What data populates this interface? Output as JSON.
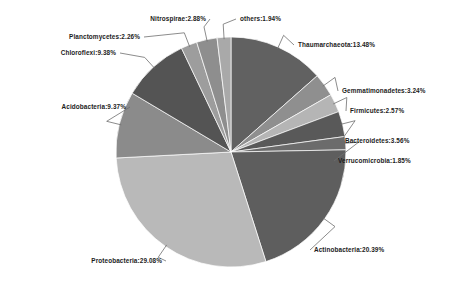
{
  "chart_data": {
    "type": "pie",
    "title": "",
    "subtitle": "",
    "xlabel": "",
    "ylabel": "",
    "legend_position": "none",
    "grid": false,
    "units": "percent",
    "label_format": "name:value%",
    "start_angle_deg": 0,
    "direction": "clockwise",
    "categories": [
      "Thaumarchaeota",
      "Gemmatimonadetes",
      "Firmicutes",
      "Bacteroidetes",
      "Verrucomicrobia",
      "Actinobacteria",
      "Proteobacteria",
      "Acidobacteria",
      "Chloroflexi",
      "Planctomycetes",
      "Nitrospirae",
      "others"
    ],
    "values": [
      13.48,
      3.24,
      2.57,
      3.56,
      1.85,
      20.39,
      29.08,
      9.37,
      9.38,
      2.26,
      2.88,
      1.94
    ],
    "colors": [
      "#616161",
      "#8f8f8f",
      "#b5b5b5",
      "#595959",
      "#6b6b6b",
      "#5e5e5e",
      "#b9b9b9",
      "#8b8b8b",
      "#545454",
      "#9d9d9d",
      "#8e8e8e",
      "#a9a9a9"
    ],
    "slices": [
      {
        "label": "Thaumarchaeota:13.48%",
        "name": "Thaumarchaeota",
        "value": 13.48,
        "color": "#616161"
      },
      {
        "label": "Gemmatimonadetes:3.24%",
        "name": "Gemmatimonadetes",
        "value": 3.24,
        "color": "#8f8f8f"
      },
      {
        "label": "Firmicutes:2.57%",
        "name": "Firmicutes",
        "value": 2.57,
        "color": "#b5b5b5"
      },
      {
        "label": "Bacteroidetes:3.56%",
        "name": "Bacteroidetes",
        "value": 3.56,
        "color": "#595959"
      },
      {
        "label": "Verrucomicrobia:1.85%",
        "name": "Verrucomicrobia",
        "value": 1.85,
        "color": "#6b6b6b"
      },
      {
        "label": "Actinobacteria:20.39%",
        "name": "Actinobacteria",
        "value": 20.39,
        "color": "#5e5e5e"
      },
      {
        "label": "Proteobacteria:29.08%",
        "name": "Proteobacteria",
        "value": 29.08,
        "color": "#b9b9b9"
      },
      {
        "label": "Acidobacteria:9.37%",
        "name": "Acidobacteria",
        "value": 9.37,
        "color": "#8b8b8b"
      },
      {
        "label": "Chloroflexi:9.38%",
        "name": "Chloroflexi",
        "value": 9.38,
        "color": "#545454"
      },
      {
        "label": "Planctomycetes:2.26%",
        "name": "Planctomycetes",
        "value": 2.26,
        "color": "#9d9d9d"
      },
      {
        "label": "Nitrospirae:2.88%",
        "name": "Nitrospirae",
        "value": 2.88,
        "color": "#8e8e8e"
      },
      {
        "label": "others:1.94%",
        "name": "others",
        "value": 1.94,
        "color": "#a9a9a9"
      }
    ]
  },
  "figure": {
    "background": "#ffffff",
    "center_x": 231,
    "center_y": 152,
    "radius": 115
  }
}
